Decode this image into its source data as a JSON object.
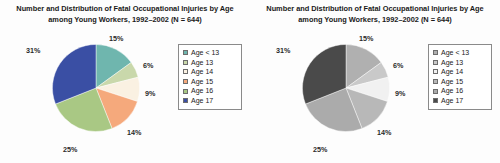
{
  "charts": [
    {
      "title": "Number and Distribution of Fatal Occupational Injuries by Age among Young Workers, 1992–2002 (N = 644)",
      "variant": "color"
    },
    {
      "title": "Number and Distribution of Fatal Occupational Injuries by Age among Young Workers, 1992–2002 (N = 644)",
      "variant": "grayscale"
    }
  ],
  "chart_data": {
    "type": "pie",
    "title": "Number and Distribution of Fatal Occupational Injuries by Age among Young Workers, 1992–2002 (N = 644)",
    "total_n": 644,
    "categories": [
      "Age < 13",
      "Age 13",
      "Age 14",
      "Age 15",
      "Age 16",
      "Age 17"
    ],
    "values": [
      15,
      6,
      9,
      14,
      25,
      31
    ],
    "value_labels": [
      "15%",
      "6%",
      "9%",
      "14%",
      "25%",
      "31%"
    ],
    "units": "percent",
    "start_angle_deg": 0,
    "direction": "clockwise",
    "legend_position": "right",
    "grid": false,
    "colors": [
      "#6fb6ae",
      "#c9d8ab",
      "#faf1e2",
      "#f5a97c",
      "#a9c884",
      "#3a4fa4"
    ],
    "colors_grayscale": [
      "#b0b0b0",
      "#c9c9c9",
      "#f1f1f1",
      "#b8b8b8",
      "#ababab",
      "#4a4a4a"
    ],
    "legend_items": [
      {
        "label": "Age < 13",
        "color": "#6fb6ae",
        "color_gray": "#b0b0b0",
        "value": 15
      },
      {
        "label": "Age 13",
        "color": "#c9d8ab",
        "color_gray": "#c9c9c9",
        "value": 6
      },
      {
        "label": "Age 14",
        "color": "#faf1e2",
        "color_gray": "#f1f1f1",
        "value": 9
      },
      {
        "label": "Age 15",
        "color": "#f5a97c",
        "color_gray": "#b8b8b8",
        "value": 14
      },
      {
        "label": "Age 16",
        "color": "#a9c884",
        "color_gray": "#ababab",
        "value": 25
      },
      {
        "label": "Age 17",
        "color": "#3a4fa4",
        "color_gray": "#4a4a4a",
        "value": 31
      }
    ]
  }
}
